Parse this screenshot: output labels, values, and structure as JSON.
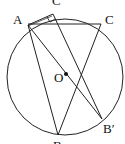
{
  "diagram": {
    "type": "circle-geometry",
    "circle": {
      "center": "O",
      "cx": 65,
      "cy": 77,
      "r": 58
    },
    "points": [
      {
        "id": "A",
        "label": "A",
        "x": 28,
        "y": 29
      },
      {
        "id": "C",
        "label": "C",
        "x": 101,
        "y": 24
      },
      {
        "id": "Cp",
        "label": "C",
        "x": 53,
        "y": 14
      },
      {
        "id": "O",
        "label": "O",
        "x": 66,
        "y": 74
      },
      {
        "id": "B",
        "label": "B",
        "x": 58,
        "y": 135
      },
      {
        "id": "Bp",
        "label": "B′",
        "x": 102,
        "y": 119
      }
    ],
    "segments": [
      [
        "A",
        "C"
      ],
      [
        "A",
        "B"
      ],
      [
        "A",
        "Bp"
      ],
      [
        "C",
        "B"
      ],
      [
        "Cp",
        "Bp"
      ],
      [
        "A",
        "Cp"
      ]
    ],
    "right_angle_at": "Cp",
    "labels": {
      "A": "A",
      "C": "C",
      "Cp": "C",
      "O": "O",
      "B": "B",
      "Bp": "B′"
    }
  }
}
